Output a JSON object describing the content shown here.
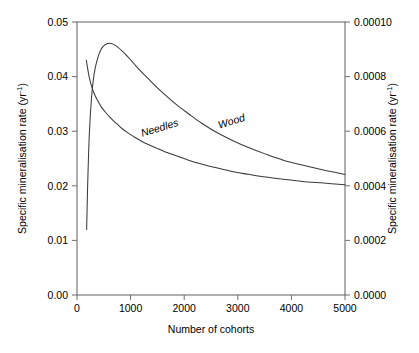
{
  "chart_data": {
    "type": "line",
    "title": "",
    "xlabel": "Number of cohorts",
    "ylabel": "Specific mineralisation rate (yr⁻¹)",
    "ylabel_right": "Specific mineralisation rate (yr⁻¹)",
    "xlim": [
      0,
      5000
    ],
    "ylim": [
      0.0,
      0.05
    ],
    "ylim_right": [
      0.0,
      0.0001
    ],
    "grid": false,
    "legend": "inline-curve-labels",
    "x_ticks": [
      0,
      1000,
      2000,
      3000,
      4000,
      5000
    ],
    "x_tick_labels": [
      "0",
      "1000",
      "2000",
      "3000",
      "4000",
      "5000"
    ],
    "y_ticks_left": [
      0.0,
      0.01,
      0.02,
      0.03,
      0.04,
      0.05
    ],
    "y_tick_labels_left": [
      "0.00",
      "0.01",
      "0.02",
      "0.03",
      "0.04",
      "0.05"
    ],
    "y_ticks_right": [
      0.0,
      0.0002,
      0.0004,
      0.0006,
      0.0008,
      0.0001
    ],
    "y_tick_labels_right": [
      "0.0000",
      "0.0002",
      "0.0004",
      "0.0006",
      "0.0008",
      "0.00010"
    ],
    "series": [
      {
        "name": "Wood",
        "label": "Wood",
        "label_x": 2900,
        "label_y": 0.0312,
        "label_rotation": -17,
        "x": [
          180,
          200,
          230,
          270,
          320,
          380,
          450,
          520,
          600,
          680,
          760,
          850,
          950,
          1060,
          1180,
          1320,
          1480,
          1650,
          1850,
          2080,
          2320,
          2600,
          2900,
          3200,
          3520,
          3850,
          4200,
          4600,
          5000
        ],
        "y": [
          0.012,
          0.0205,
          0.0295,
          0.036,
          0.0405,
          0.0432,
          0.045,
          0.0458,
          0.0461,
          0.0459,
          0.0454,
          0.0446,
          0.0436,
          0.0424,
          0.0411,
          0.0397,
          0.0381,
          0.0366,
          0.0349,
          0.0332,
          0.0315,
          0.0298,
          0.0283,
          0.027,
          0.0258,
          0.0247,
          0.0238,
          0.0229,
          0.0221
        ]
      },
      {
        "name": "Needles",
        "label": "Needles",
        "label_x": 1560,
        "label_y": 0.03,
        "label_rotation": -17,
        "x": [
          175,
          200,
          230,
          270,
          320,
          380,
          450,
          520,
          600,
          680,
          760,
          850,
          950,
          1060,
          1180,
          1320,
          1480,
          1650,
          1850,
          2080,
          2320,
          2600,
          2900,
          3200,
          3520,
          3850,
          4200,
          4600,
          5000
        ],
        "y": [
          0.043,
          0.0414,
          0.0398,
          0.0383,
          0.0369,
          0.0357,
          0.0345,
          0.0336,
          0.0327,
          0.0319,
          0.0312,
          0.0304,
          0.0297,
          0.029,
          0.0283,
          0.0276,
          0.0269,
          0.0262,
          0.0255,
          0.0247,
          0.024,
          0.0233,
          0.0226,
          0.0221,
          0.0216,
          0.0212,
          0.0208,
          0.0205,
          0.0202
        ]
      }
    ]
  },
  "layout": {
    "plot_left": 77,
    "plot_right": 345,
    "plot_top": 22,
    "plot_bottom": 295
  },
  "colors": {
    "curve": "#3a3a3a",
    "axis": "#6e6e6e",
    "text": "#000000",
    "background": "#ffffff"
  }
}
